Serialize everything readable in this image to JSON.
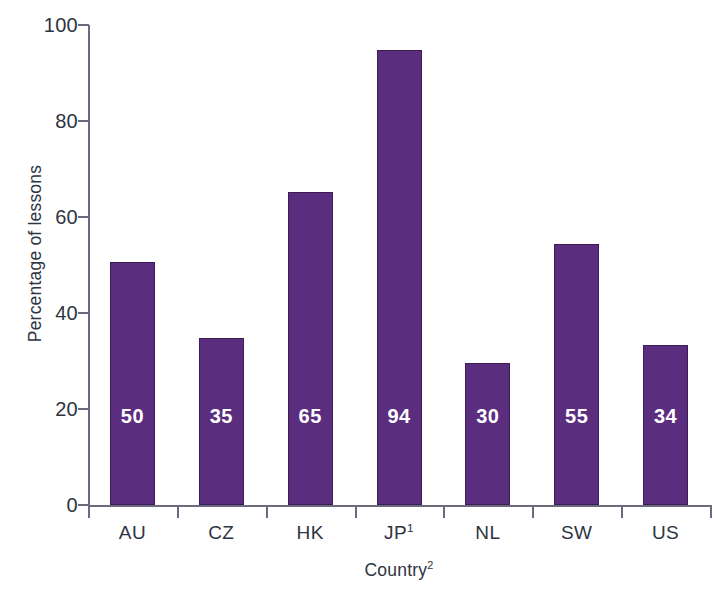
{
  "chart_data": {
    "type": "bar",
    "title": "",
    "xlabel": "Country2",
    "xlabel_text": "Country",
    "xlabel_superscript": "2",
    "ylabel": "Percentage of lessons",
    "categories": [
      "AU",
      "CZ",
      "HK",
      "JP1",
      "NL",
      "SW",
      "US"
    ],
    "values": [
      50,
      35,
      65,
      94,
      30,
      55,
      34
    ],
    "bar_heights": [
      50.7,
      34.8,
      65.2,
      94.8,
      29.6,
      54.4,
      33.3
    ],
    "data_labels": [
      "50",
      "35",
      "65",
      "94",
      "30",
      "55",
      "34"
    ],
    "ylim": [
      0,
      100
    ],
    "yticks": [
      0,
      20,
      40,
      60,
      80,
      100
    ],
    "ytick_labels": [
      "0",
      "20",
      "40",
      "60",
      "80",
      "100"
    ],
    "grid": false,
    "legend": false,
    "bar_color": "#5B2D7E",
    "bar_border_color": "#3D1C56",
    "axis_color": "#6B6B80",
    "text_color": "#2E3440",
    "label_color": "#FFFFFF",
    "background": "#FFFFFF"
  },
  "axes": {
    "x_categories": [
      {
        "label": "AU",
        "superscript": ""
      },
      {
        "label": "CZ",
        "superscript": ""
      },
      {
        "label": "HK",
        "superscript": ""
      },
      {
        "label": "JP",
        "superscript": "1"
      },
      {
        "label": "NL",
        "superscript": ""
      },
      {
        "label": "SW",
        "superscript": ""
      },
      {
        "label": "US",
        "superscript": ""
      }
    ]
  }
}
